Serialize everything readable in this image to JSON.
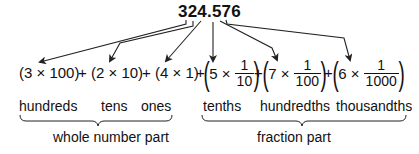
{
  "diagram": {
    "number": "324.576",
    "terms": [
      {
        "text": "(3 × 100)",
        "digit": "3",
        "value": "100",
        "type": "whole"
      },
      {
        "text": "(2 × 10)",
        "digit": "2",
        "value": "10",
        "type": "whole"
      },
      {
        "text": "(4 × 1)",
        "digit": "4",
        "value": "1",
        "type": "whole"
      },
      {
        "digit": "5",
        "times": "×",
        "numerator": "1",
        "denominator": "10",
        "type": "fraction"
      },
      {
        "digit": "7",
        "times": "×",
        "numerator": "1",
        "denominator": "100",
        "type": "fraction"
      },
      {
        "digit": "6",
        "times": "×",
        "numerator": "1",
        "denominator": "1000",
        "type": "fraction"
      }
    ],
    "plus": "+",
    "place_names": [
      "hundreds",
      "tens",
      "ones",
      "tenths",
      "hundredths",
      "thousandths"
    ],
    "groups": {
      "whole": "whole number part",
      "fraction": "fraction part"
    },
    "line_color": "#222222"
  }
}
